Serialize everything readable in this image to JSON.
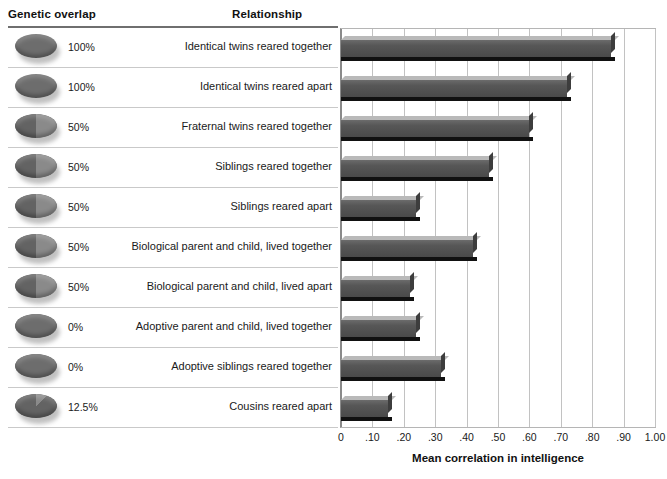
{
  "headers": {
    "genetic_overlap": "Genetic overlap",
    "relationship": "Relationship"
  },
  "axis": {
    "title": "Mean correlation in intelligence",
    "ticks": [
      "0",
      ".10",
      ".20",
      ".30",
      ".40",
      ".50",
      ".60",
      ".70",
      ".80",
      ".90",
      "1.00"
    ]
  },
  "rows": [
    {
      "overlap": "100%",
      "overlap_fraction": 1.0,
      "relationship": "Identical twins reared together",
      "value": 0.86
    },
    {
      "overlap": "100%",
      "overlap_fraction": 1.0,
      "relationship": "Identical twins reared apart",
      "value": 0.72
    },
    {
      "overlap": "50%",
      "overlap_fraction": 0.5,
      "relationship": "Fraternal twins reared together",
      "value": 0.6
    },
    {
      "overlap": "50%",
      "overlap_fraction": 0.5,
      "relationship": "Siblings reared together",
      "value": 0.47
    },
    {
      "overlap": "50%",
      "overlap_fraction": 0.5,
      "relationship": "Siblings reared apart",
      "value": 0.24
    },
    {
      "overlap": "50%",
      "overlap_fraction": 0.5,
      "relationship": "Biological parent and child, lived together",
      "value": 0.42
    },
    {
      "overlap": "50%",
      "overlap_fraction": 0.5,
      "relationship": "Biological parent and child, lived apart",
      "value": 0.22
    },
    {
      "overlap": "0%",
      "overlap_fraction": 0.0,
      "relationship": "Adoptive parent and child, lived together",
      "value": 0.24
    },
    {
      "overlap": "0%",
      "overlap_fraction": 0.0,
      "relationship": "Adoptive siblings reared together",
      "value": 0.32
    },
    {
      "overlap": "12.5%",
      "overlap_fraction": 0.125,
      "relationship": "Cousins reared apart",
      "value": 0.15
    }
  ],
  "colors": {
    "bar_face": "#4e4e4e",
    "bar_top": "#b9b9b9",
    "bar_shadow": "#111111",
    "gridline": "#c2c2c2",
    "rule": "#6f6f6f",
    "text": "#1a1a1a"
  },
  "chart_data": {
    "type": "bar",
    "orientation": "horizontal",
    "title": "",
    "xlabel": "Mean correlation in intelligence",
    "ylabel": "",
    "xlim": [
      0,
      1.0
    ],
    "xticks": [
      0,
      0.1,
      0.2,
      0.3,
      0.4,
      0.5,
      0.6,
      0.7,
      0.8,
      0.9,
      1.0
    ],
    "xticklabels": [
      "0",
      ".10",
      ".20",
      ".30",
      ".40",
      ".50",
      ".60",
      ".70",
      ".80",
      ".90",
      "1.00"
    ],
    "grid": true,
    "grid_axis": "x",
    "legend": false,
    "categories": [
      "Identical twins reared together",
      "Identical twins reared apart",
      "Fraternal twins reared together",
      "Siblings reared together",
      "Siblings reared apart",
      "Biological parent and child, lived together",
      "Biological parent and child, lived apart",
      "Adoptive parent and child, lived together",
      "Adoptive siblings reared together",
      "Cousins reared apart"
    ],
    "values": [
      0.86,
      0.72,
      0.6,
      0.47,
      0.24,
      0.42,
      0.22,
      0.24,
      0.32,
      0.15
    ],
    "annotations": {
      "genetic_overlap": [
        "100%",
        "100%",
        "50%",
        "50%",
        "50%",
        "50%",
        "50%",
        "0%",
        "0%",
        "12.5%"
      ]
    }
  }
}
